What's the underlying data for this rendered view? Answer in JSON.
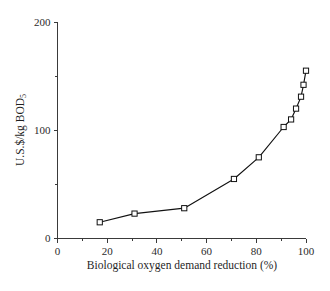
{
  "chart_data": {
    "type": "line",
    "title": "",
    "xlabel": "Biological oxygen demand reduction (%)",
    "ylabel": "U.S.$/kg BOD",
    "ylabel_subscript": "5",
    "xlim": [
      0,
      100
    ],
    "ylim": [
      0,
      200
    ],
    "xticks": [
      0,
      20,
      40,
      60,
      80,
      100
    ],
    "xtick_labels": [
      "0",
      "20",
      "40",
      "60",
      "80",
      "100"
    ],
    "yticks": [
      0,
      100,
      200
    ],
    "ytick_labels": [
      "0",
      "100",
      "200"
    ],
    "yticks_minor": [
      50,
      150
    ],
    "xticks_minor": [
      10,
      30,
      50,
      70,
      90
    ],
    "grid": false,
    "legend": null,
    "marker": "open-square",
    "line_color": "#111111",
    "marker_face_color": "#ffffff",
    "marker_edge_color": "#111111",
    "x": [
      17,
      31,
      51,
      71,
      81,
      91,
      94,
      96,
      98,
      99,
      100
    ],
    "values": [
      15,
      23,
      28,
      55,
      75,
      103,
      110,
      120,
      131,
      142,
      155
    ],
    "series": [
      {
        "name": "Cost of BOD reduction",
        "x": [
          17,
          31,
          51,
          71,
          81,
          91,
          94,
          96,
          98,
          99,
          100
        ],
        "values": [
          15,
          23,
          28,
          55,
          75,
          103,
          110,
          120,
          131,
          142,
          155
        ]
      }
    ]
  },
  "figure": {
    "background_color": "#ffffff",
    "axis_color": "#3a3a3a",
    "text_color": "#1f1f1f"
  }
}
